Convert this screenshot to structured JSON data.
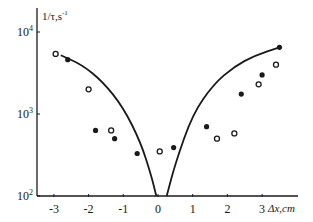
{
  "chart_data": {
    "type": "scatter",
    "title": "",
    "xlabel": "Δx,cm",
    "ylabel": "1/τ,s⁻¹",
    "x_ticks": [
      -3,
      -2,
      -1,
      0,
      1,
      2,
      3
    ],
    "x_tick_labels": [
      "-3",
      "-2",
      "-1",
      "0",
      "1",
      "2",
      "3"
    ],
    "y_scale": "log",
    "y_ticks": [
      100,
      1000,
      10000
    ],
    "y_tick_labels": [
      {
        "base": "10",
        "exp": "2"
      },
      {
        "base": "10",
        "exp": "3"
      },
      {
        "base": "10",
        "exp": "4"
      }
    ],
    "xlim": [
      -3.4,
      4.0
    ],
    "ylim": [
      100,
      15000
    ],
    "grid": false,
    "legend": null,
    "series": [
      {
        "name": "filled circles",
        "marker": "filled-circle",
        "points": [
          {
            "x": -2.6,
            "y": 4600
          },
          {
            "x": -1.8,
            "y": 630
          },
          {
            "x": -1.25,
            "y": 500
          },
          {
            "x": -0.6,
            "y": 330
          },
          {
            "x": 0.45,
            "y": 390
          },
          {
            "x": 1.4,
            "y": 700
          },
          {
            "x": 2.4,
            "y": 1750
          },
          {
            "x": 3.0,
            "y": 3000
          },
          {
            "x": 3.5,
            "y": 6500
          }
        ]
      },
      {
        "name": "open circles",
        "marker": "open-circle",
        "points": [
          {
            "x": -2.95,
            "y": 5400
          },
          {
            "x": -2.0,
            "y": 2000
          },
          {
            "x": -1.35,
            "y": 630
          },
          {
            "x": 0.05,
            "y": 350
          },
          {
            "x": 1.7,
            "y": 500
          },
          {
            "x": 2.2,
            "y": 580
          },
          {
            "x": 2.9,
            "y": 2300
          },
          {
            "x": 3.4,
            "y": 4000
          }
        ]
      },
      {
        "name": "theory curve",
        "marker": "line",
        "left_branch": [
          {
            "x": -2.8,
            "y": 5200
          },
          {
            "x": -2.2,
            "y": 4000
          },
          {
            "x": -1.6,
            "y": 2500
          },
          {
            "x": -1.0,
            "y": 1200
          },
          {
            "x": -0.5,
            "y": 450
          },
          {
            "x": -0.2,
            "y": 180
          },
          {
            "x": -0.05,
            "y": 100
          }
        ],
        "right_branch": [
          {
            "x": 0.25,
            "y": 100
          },
          {
            "x": 0.5,
            "y": 250
          },
          {
            "x": 1.0,
            "y": 1000
          },
          {
            "x": 1.6,
            "y": 2300
          },
          {
            "x": 2.2,
            "y": 3800
          },
          {
            "x": 2.8,
            "y": 5200
          },
          {
            "x": 3.5,
            "y": 6500
          }
        ]
      }
    ]
  }
}
